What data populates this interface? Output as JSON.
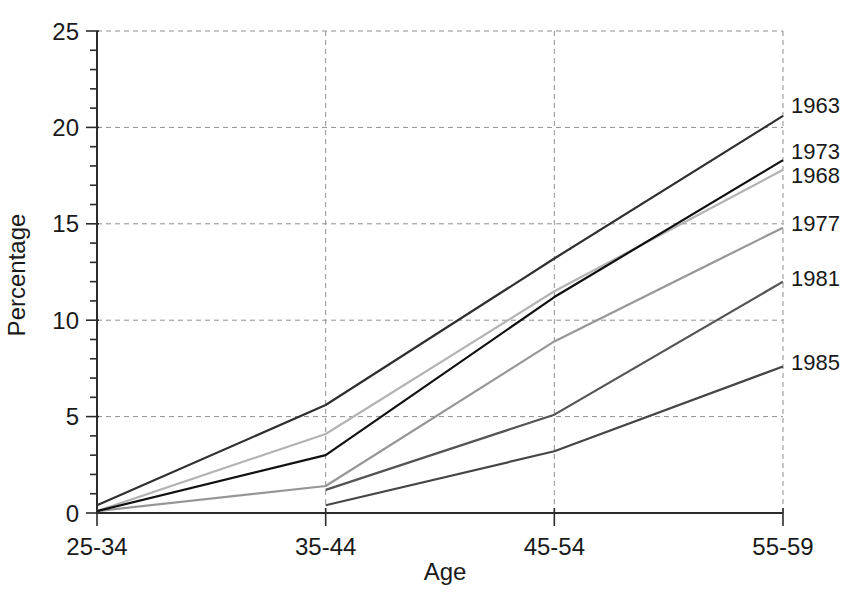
{
  "chart_data": {
    "type": "line",
    "title": "",
    "xlabel": "Age",
    "ylabel": "Percentage",
    "categories": [
      "25-34",
      "35-44",
      "45-54",
      "55-59"
    ],
    "ylim": [
      0,
      25
    ],
    "y_major_ticks": [
      0,
      5,
      10,
      15,
      20,
      25
    ],
    "y_minor_step": 1,
    "grid": "dashed",
    "grid_color": "#909090",
    "axis_color": "#2b2b2b",
    "legend_position": "right-end-labels",
    "series": [
      {
        "name": "1963",
        "color": "#2f2f2f",
        "values": [
          0.4,
          5.6,
          13.2,
          20.6
        ],
        "label_dy": -11,
        "z": 5
      },
      {
        "name": "1973",
        "color": "#101010",
        "values": [
          0.1,
          3.0,
          11.2,
          18.3
        ],
        "label_dy": -9,
        "z": 6
      },
      {
        "name": "1968",
        "color": "#b3b3b3",
        "values": [
          0.1,
          4.1,
          11.5,
          17.8
        ],
        "label_dy": 5,
        "z": 1
      },
      {
        "name": "1977",
        "color": "#969696",
        "values": [
          0.1,
          1.4,
          8.9,
          14.8
        ],
        "label_dy": -5,
        "z": 2
      },
      {
        "name": "1981",
        "color": "#545454",
        "values": [
          null,
          1.2,
          5.1,
          12.0
        ],
        "label_dy": -4,
        "z": 4
      },
      {
        "name": "1985",
        "color": "#454545",
        "values": [
          null,
          0.4,
          3.2,
          7.6
        ],
        "label_dy": -4,
        "z": 3
      }
    ]
  }
}
